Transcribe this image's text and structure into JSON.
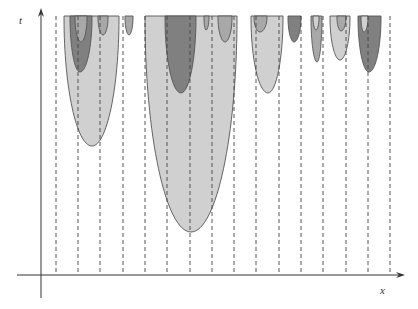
{
  "diagram": {
    "axes": {
      "x_label": "x",
      "t_label": "t",
      "origin": [
        41,
        275
      ],
      "x_end": 405,
      "t_top": 8
    },
    "grid": {
      "style": "dashed vertical lines",
      "x_positions": [
        56,
        78,
        100,
        123,
        145,
        167,
        190,
        212,
        234,
        256,
        279,
        301,
        323,
        346,
        368,
        390
      ],
      "top": 16,
      "bottom": 275
    },
    "colors": {
      "light": "#d0d0d0",
      "medium": "#a8a8a8",
      "dark": "#808080",
      "stroke": "#555555",
      "grid": "#444444",
      "axis": "#333333"
    },
    "regions": [
      {
        "name": "left-outer",
        "tone": "light",
        "x1": 64,
        "x2": 119,
        "tip_x": 92,
        "tip_y": 146
      },
      {
        "name": "left-middle",
        "tone": "dark",
        "x1": 70,
        "x2": 92,
        "tip_x": 80,
        "tip_y": 72
      },
      {
        "name": "left-inner",
        "tone": "medium",
        "x1": 75,
        "x2": 87,
        "tip_x": 81,
        "tip_y": 42
      },
      {
        "name": "left-small",
        "tone": "medium",
        "x1": 98,
        "x2": 108,
        "tip_x": 103,
        "tip_y": 35
      },
      {
        "name": "small-2",
        "tone": "medium",
        "x1": 125,
        "x2": 133,
        "tip_x": 129,
        "tip_y": 35
      },
      {
        "name": "center-outer",
        "tone": "light",
        "x1": 145,
        "x2": 237,
        "tip_x": 191,
        "tip_y": 232
      },
      {
        "name": "center-inner",
        "tone": "dark",
        "x1": 165,
        "x2": 196,
        "tip_x": 181,
        "tip_y": 93
      },
      {
        "name": "center-tiny",
        "tone": "medium",
        "x1": 204,
        "x2": 209,
        "tip_x": 206,
        "tip_y": 30
      },
      {
        "name": "center-small",
        "tone": "medium",
        "x1": 218,
        "x2": 232,
        "tip_x": 225,
        "tip_y": 42
      },
      {
        "name": "right-a-outer",
        "tone": "light",
        "x1": 251,
        "x2": 283,
        "tip_x": 268,
        "tip_y": 93
      },
      {
        "name": "right-a-inner",
        "tone": "medium",
        "x1": 254,
        "x2": 267,
        "tip_x": 260,
        "tip_y": 32
      },
      {
        "name": "right-b",
        "tone": "dark",
        "x1": 288,
        "x2": 301,
        "tip_x": 294,
        "tip_y": 42
      },
      {
        "name": "right-c-outer",
        "tone": "medium",
        "x1": 311,
        "x2": 322,
        "tip_x": 317,
        "tip_y": 62
      },
      {
        "name": "right-c-inner",
        "tone": "light",
        "x1": 313,
        "x2": 319,
        "tip_x": 316,
        "tip_y": 30
      },
      {
        "name": "right-d-outer",
        "tone": "light",
        "x1": 330,
        "x2": 350,
        "tip_x": 340,
        "tip_y": 60
      },
      {
        "name": "right-d-inner",
        "tone": "medium",
        "x1": 337,
        "x2": 346,
        "tip_x": 341,
        "tip_y": 31
      },
      {
        "name": "right-e-outer",
        "tone": "dark",
        "x1": 358,
        "x2": 381,
        "tip_x": 369,
        "tip_y": 72
      },
      {
        "name": "right-e-inner",
        "tone": "light",
        "x1": 361,
        "x2": 368,
        "tip_x": 364,
        "tip_y": 32
      }
    ]
  }
}
